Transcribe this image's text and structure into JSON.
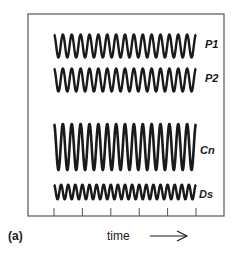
{
  "chart_data": {
    "type": "line",
    "title": "",
    "panel_label": "(a)",
    "xlabel": "time",
    "xlabel_arrow": "→",
    "ylabel": "",
    "grid": false,
    "legend": "none (inline labels at right end of each trace)",
    "x_ticks_count": 6,
    "x_tick_labels": [],
    "series": [
      {
        "name": "P1",
        "waveform": "sinusoid",
        "cycles": 16,
        "relative_amplitude": 0.5,
        "baseline_y": 46
      },
      {
        "name": "P2",
        "waveform": "sinusoid",
        "cycles": 16,
        "relative_amplitude": 0.5,
        "baseline_y": 80
      },
      {
        "name": "Cn",
        "waveform": "sinusoid",
        "cycles": 16,
        "relative_amplitude": 1.0,
        "baseline_y": 147
      },
      {
        "name": "Ds",
        "waveform": "sinusoid",
        "cycles": 20,
        "relative_amplitude": 0.32,
        "baseline_y": 192
      }
    ]
  },
  "labels": {
    "P1": "P1",
    "P2": "P2",
    "Cn": "Cn",
    "Ds": "Ds",
    "panel": "(a)",
    "xaxis": "time"
  },
  "colors": {
    "ink": "#1a1a1a",
    "background": "#ffffff",
    "frame": "#555555"
  }
}
